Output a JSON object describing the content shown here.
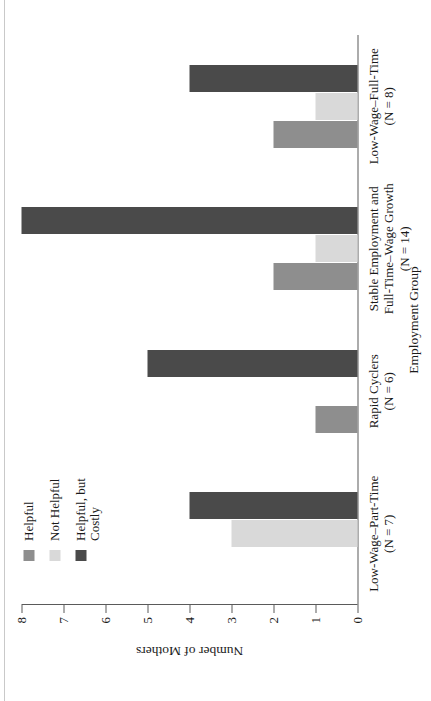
{
  "chart_data": {
    "type": "bar",
    "orientation": "vertical-grouped",
    "title": "",
    "xlabel": "Employment Group",
    "ylabel": "Number of Mothers",
    "ylim": [
      0,
      8
    ],
    "yticks": [
      0,
      1,
      2,
      3,
      4,
      5,
      6,
      7,
      8
    ],
    "ytick_labels": [
      "0",
      "1",
      "2",
      "3",
      "4",
      "5",
      "6",
      "7",
      "8"
    ],
    "grid": false,
    "legend_position": "top-left",
    "categories": [
      "Low-Wage–Part-Time\n(N = 7)",
      "Rapid Cyclers\n(N = 6)",
      "Stable Employment and\nFull-Time–Wage Growth\n(N = 14)",
      "Low-Wage–Full-Time\n(N = 8)"
    ],
    "category_lines": [
      [
        "Low-Wage–Part-Time",
        "(N = 7)"
      ],
      [
        "Rapid Cyclers",
        "(N = 6)"
      ],
      [
        "Stable Employment and",
        "Full-Time–Wage Growth",
        "(N = 14)"
      ],
      [
        "Low-Wage–Full-Time",
        "(N = 8)"
      ]
    ],
    "series": [
      {
        "name": "Helpful",
        "color": "#8e8e8e",
        "values": [
          0,
          1,
          2,
          2
        ]
      },
      {
        "name": "Not Helpful",
        "color": "#d9d9d9",
        "values": [
          3,
          0,
          1,
          1
        ]
      },
      {
        "name": "Helpful, but Costly",
        "color": "#4a4a4a",
        "values": [
          4,
          5,
          8,
          4
        ]
      }
    ]
  },
  "legend": {
    "items": [
      {
        "label": "Helpful",
        "line2": "",
        "color": "#8e8e8e"
      },
      {
        "label": "Not Helpful",
        "line2": "",
        "color": "#d9d9d9"
      },
      {
        "label": "Helpful, but",
        "line2": "Costly",
        "color": "#4a4a4a"
      }
    ]
  },
  "axes": {
    "y_title": "Number of Mothers",
    "x_title": "Employment Group",
    "y_ticks": [
      "0",
      "1",
      "2",
      "3",
      "4",
      "5",
      "6",
      "7",
      "8"
    ]
  }
}
